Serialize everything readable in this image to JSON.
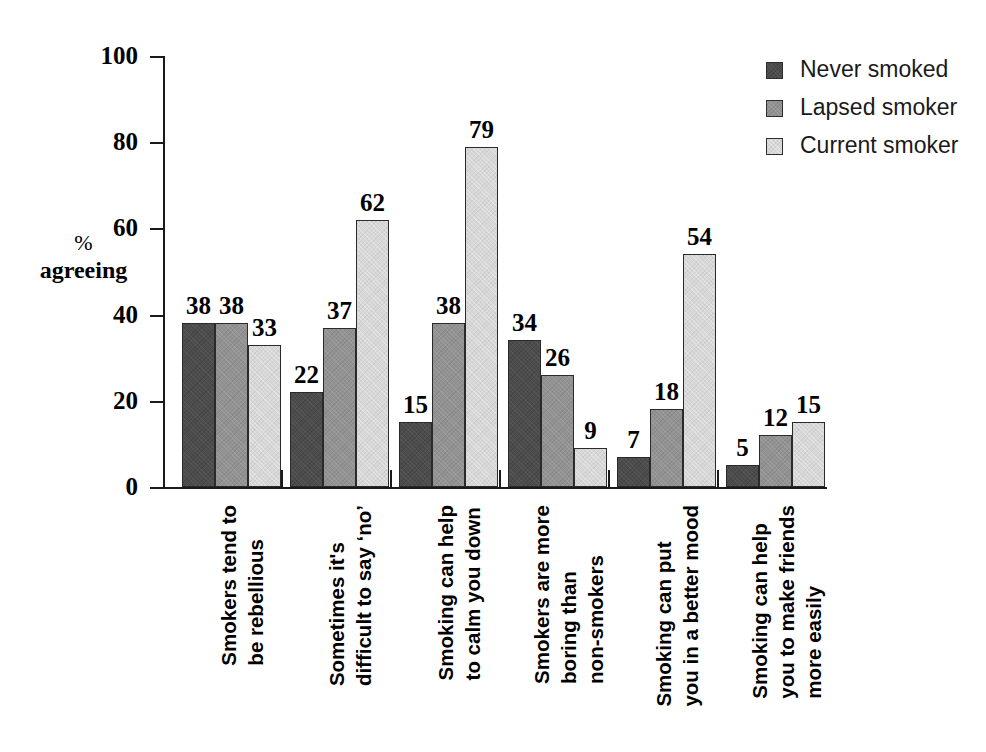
{
  "chart_data": {
    "type": "bar",
    "title": "",
    "subtitle": "",
    "xlabel": "",
    "ylabel": "% agreeing",
    "ylabel_line1": "%",
    "ylabel_line2": "agreeing",
    "ylim": [
      0,
      100
    ],
    "y_ticks": [
      0,
      20,
      40,
      60,
      80,
      100
    ],
    "y_tick_labels": [
      "0",
      "20",
      "40",
      "60",
      "80",
      "100"
    ],
    "grid": false,
    "legend_position": "top-right",
    "categories": [
      "Smokers tend to be rebellious",
      "Sometimes it's difficult to say 'no'",
      "Smoking can help to calm you down",
      "Smokers are more boring than non-smokers",
      "Smoking can put you in a better mood",
      "Smoking can help you to make friends more easily"
    ],
    "category_lines": [
      [
        "Smokers tend to",
        "be rebellious"
      ],
      [
        "Sometimes it's",
        "difficult to say ‘no’"
      ],
      [
        "Smoking can help",
        "to calm you down"
      ],
      [
        "Smokers are more",
        "boring than",
        "non-smokers"
      ],
      [
        "Smoking can put",
        "you in a better mood"
      ],
      [
        "Smoking can help",
        "you to make friends",
        "more easily"
      ]
    ],
    "series": [
      {
        "name": "Never smoked",
        "color": "#4c4c4c",
        "values": [
          38,
          22,
          15,
          34,
          7,
          5
        ]
      },
      {
        "name": "Lapsed smoker",
        "color": "#929292",
        "values": [
          38,
          37,
          38,
          26,
          18,
          12
        ]
      },
      {
        "name": "Current smoker",
        "color": "#d7d7d7",
        "values": [
          33,
          62,
          79,
          9,
          54,
          15
        ]
      }
    ],
    "data_labels": [
      [
        "38",
        "38",
        "33"
      ],
      [
        "22",
        "37",
        "62"
      ],
      [
        "15",
        "38",
        "79"
      ],
      [
        "34",
        "26",
        "9"
      ],
      [
        "7",
        "18",
        "54"
      ],
      [
        "5",
        "12",
        "15"
      ]
    ]
  },
  "legend": {
    "items": [
      {
        "label": "Never smoked",
        "color": "#4c4c4c"
      },
      {
        "label": "Lapsed smoker",
        "color": "#929292"
      },
      {
        "label": "Current smoker",
        "color": "#d7d7d7"
      }
    ]
  }
}
